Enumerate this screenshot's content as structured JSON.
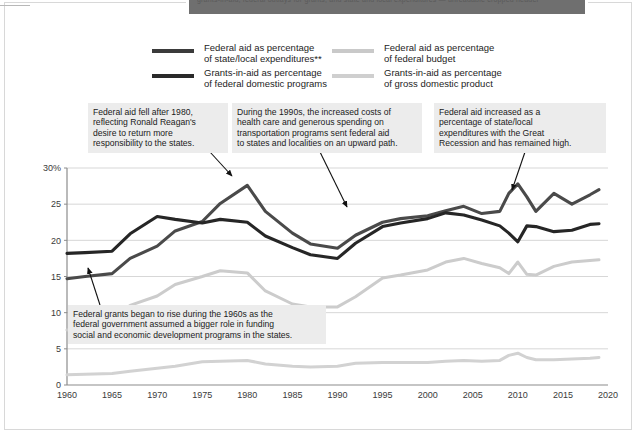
{
  "banner": {
    "text": "grants-in-aid, federal outlays for grants, and state and local expenditures — unreadable cropped header"
  },
  "legend": {
    "items": [
      {
        "label": "Federal aid as percentage\nof state/local expenditures**",
        "color": "#3b3b3b",
        "name": "legend-federal-aid-state-local"
      },
      {
        "label": "Grants-in-aid as percentage\nof federal domestic programs",
        "color": "#2a2a2a",
        "name": "legend-grants-federal-domestic"
      },
      {
        "label": "Federal aid as percentage\nof federal budget",
        "color": "#c9c9c9",
        "name": "legend-federal-aid-budget"
      },
      {
        "label": "Grants-in-aid as percentage\nof gross domestic product",
        "color": "#cfcfcf",
        "name": "legend-grants-gdp"
      }
    ]
  },
  "annotations": [
    {
      "id": "reagan",
      "text": "Federal aid fell after 1980,\nreflecting Ronald Reagan's\ndesire to return more\nresponsibility to the states."
    },
    {
      "id": "nineties",
      "text": "During the 1990s, the increased costs of\nhealth care and generous spending on\ntransportation programs sent federal aid\nto states and localities on an upward path."
    },
    {
      "id": "recession",
      "text": "Federal aid increased as a\npercentage of state/local\nexpenditures with the Great\nRecession and has remained high."
    },
    {
      "id": "sixties",
      "text": "Federal grants began to rise during the 1960s as the\nfederal government assumed a bigger role in funding\nsocial and economic development programs in the states."
    }
  ],
  "chart_data": {
    "type": "line",
    "title": "",
    "xlabel": "",
    "ylabel": "",
    "xlim": [
      1960,
      2020
    ],
    "ylim": [
      0,
      30
    ],
    "ytick_labels": [
      "0",
      "5",
      "10",
      "15",
      "20",
      "25",
      "30%"
    ],
    "yticks": [
      0,
      5,
      10,
      15,
      20,
      25,
      30
    ],
    "xticks": [
      1960,
      1965,
      1970,
      1975,
      1980,
      1985,
      1990,
      1995,
      2000,
      2005,
      2010,
      2015,
      2020
    ],
    "grid": "horizontal",
    "legend_position": "top",
    "x": [
      1960,
      1962,
      1965,
      1967,
      1970,
      1972,
      1975,
      1977,
      1980,
      1982,
      1985,
      1987,
      1990,
      1992,
      1995,
      1997,
      2000,
      2002,
      2004,
      2006,
      2008,
      2009,
      2010,
      2011,
      2012,
      2014,
      2016,
      2018,
      2019
    ],
    "series": [
      {
        "name": "Federal aid as percentage of state/local expenditures**",
        "color": "#4a4a4a",
        "values": [
          14.7,
          15.0,
          15.4,
          17.5,
          19.2,
          21.3,
          22.6,
          25.1,
          27.6,
          24.0,
          21.0,
          19.5,
          18.9,
          20.7,
          22.5,
          23.0,
          23.4,
          24.1,
          24.7,
          23.7,
          24.0,
          26.5,
          27.8,
          26.0,
          24.0,
          26.5,
          25.0,
          26.3,
          27.0
        ]
      },
      {
        "name": "Grants-in-aid as percentage of federal domestic programs",
        "color": "#262626",
        "values": [
          18.2,
          18.3,
          18.5,
          20.9,
          23.3,
          22.9,
          22.4,
          22.9,
          22.5,
          20.6,
          19.0,
          18.0,
          17.5,
          19.6,
          21.9,
          22.4,
          23.0,
          23.8,
          23.5,
          22.8,
          22.0,
          21.0,
          19.8,
          22.0,
          21.9,
          21.2,
          21.4,
          22.2,
          22.3
        ]
      },
      {
        "name": "Federal aid as percentage of federal budget",
        "color": "#cccccc",
        "values": [
          7.6,
          8.0,
          9.2,
          11.0,
          12.3,
          13.9,
          15.0,
          15.8,
          15.5,
          13.0,
          11.2,
          10.8,
          10.8,
          12.2,
          14.8,
          15.2,
          15.9,
          17.0,
          17.5,
          16.8,
          16.2,
          15.4,
          17.0,
          15.3,
          15.2,
          16.4,
          17.0,
          17.2,
          17.3
        ]
      },
      {
        "name": "Grants-in-aid as percentage of gross domestic product",
        "color": "#d2d2d2",
        "values": [
          1.4,
          1.5,
          1.6,
          1.9,
          2.3,
          2.6,
          3.2,
          3.3,
          3.4,
          2.9,
          2.6,
          2.5,
          2.6,
          3.0,
          3.1,
          3.1,
          3.1,
          3.3,
          3.4,
          3.3,
          3.4,
          4.1,
          4.4,
          3.8,
          3.5,
          3.5,
          3.6,
          3.7,
          3.8
        ]
      }
    ],
    "annotation_arrows": [
      {
        "from": [
          210,
          152
        ],
        "to": [
          232,
          176
        ],
        "for": "reagan"
      },
      {
        "from": [
          320,
          152
        ],
        "to": [
          347,
          207
        ],
        "for": "nineties"
      },
      {
        "from": [
          525,
          152
        ],
        "to": [
          512,
          190
        ],
        "for": "recession"
      },
      {
        "from": [
          100,
          305
        ],
        "to": [
          88,
          268
        ],
        "for": "sixties"
      }
    ]
  }
}
